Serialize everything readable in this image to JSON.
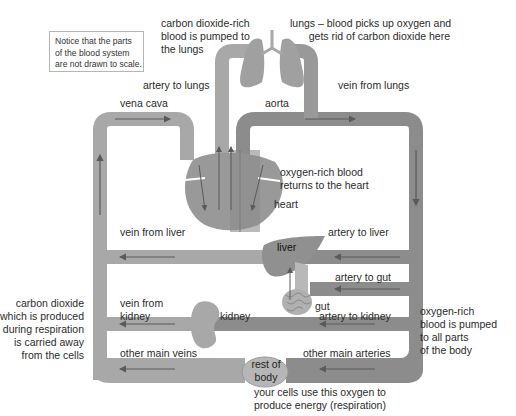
{
  "note": {
    "lines": [
      "Notice that the parts",
      "of the blood system",
      "are not drawn to scale."
    ]
  },
  "labels": {
    "co2_pumped": [
      "carbon dioxide-rich",
      "blood is pumped to",
      "the lungs"
    ],
    "lungs": [
      "lungs – blood picks up oxygen and",
      "gets rid of carbon dioxide here"
    ],
    "artery_to_lungs": "artery to lungs",
    "vein_from_lungs": "vein from lungs",
    "vena_cava": "vena cava",
    "aorta": "aorta",
    "oxygen_returns": [
      "oxygen-rich blood",
      "returns to the heart"
    ],
    "heart": "heart",
    "vein_from_liver": "vein from liver",
    "artery_to_liver": "artery to liver",
    "liver": "liver",
    "artery_to_gut": "artery to gut",
    "gut": "gut",
    "vein_from_kidney": [
      "vein from",
      "kidney"
    ],
    "kidney": "kidney",
    "artery_to_kidney": "artery to kidney",
    "other_main_veins": "other main veins",
    "other_main_arteries": "other main arteries",
    "rest_of_body": [
      "rest of",
      "body"
    ],
    "co2_carried_away": [
      "carbon dioxide",
      "which is produced",
      "during respiration",
      "is carried away",
      "from the cells"
    ],
    "oxygen_pumped_body": [
      "oxygen-rich",
      "blood is pumped",
      "to all parts",
      "of the body"
    ],
    "cells_use_oxygen": [
      "your cells use this oxygen to",
      "produce energy (respiration)"
    ]
  },
  "colors": {
    "vein": "#a8a8a8",
    "artery": "#8c8c8c",
    "organ": "#9a9a9a",
    "organ_light": "#b8b8b8",
    "arrow": "#5a5a5a",
    "text": "#2b2b2b"
  }
}
